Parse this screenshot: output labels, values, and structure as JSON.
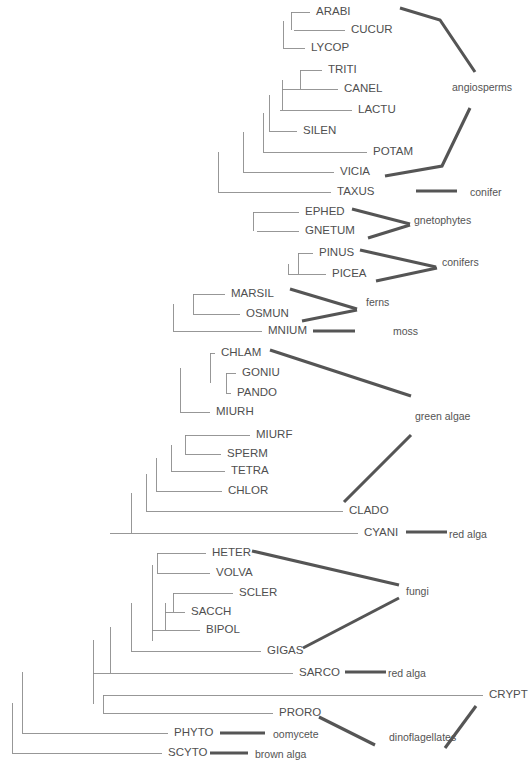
{
  "figure": {
    "type": "phylogenetic-tree",
    "orientation": "left-to-right-rectangular-cladogram",
    "line_color": "#8c8c8c",
    "bracket_color": "#555555",
    "text_color": "#4f4f4f",
    "background": "#ffffff",
    "width": 531,
    "height": 774
  },
  "taxa": [
    {
      "id": "ARABI",
      "label": "ARABI",
      "y": 12,
      "tip_x": 310,
      "label_x": 316
    },
    {
      "id": "CUCUR",
      "label": "CUCUR",
      "y": 30,
      "tip_x": 345,
      "label_x": 351
    },
    {
      "id": "LYCOP",
      "label": "LYCOP",
      "y": 48,
      "tip_x": 305,
      "label_x": 311
    },
    {
      "id": "TRITI",
      "label": "TRITI",
      "y": 70,
      "tip_x": 322,
      "label_x": 328
    },
    {
      "id": "CANEL",
      "label": "CANEL",
      "y": 89,
      "tip_x": 338,
      "label_x": 344
    },
    {
      "id": "LACTU",
      "label": "LACTU",
      "y": 110,
      "tip_x": 352,
      "label_x": 358
    },
    {
      "id": "SILEN",
      "label": "SILEN",
      "y": 131,
      "tip_x": 297,
      "label_x": 303
    },
    {
      "id": "POTAM",
      "label": "POTAM",
      "y": 152,
      "tip_x": 367,
      "label_x": 373
    },
    {
      "id": "VICIA",
      "label": "VICIA",
      "y": 172,
      "tip_x": 334,
      "label_x": 340
    },
    {
      "id": "TAXUS",
      "label": "TAXUS",
      "y": 192,
      "tip_x": 331,
      "label_x": 337
    },
    {
      "id": "EPHED",
      "label": "EPHED",
      "y": 212,
      "tip_x": 299,
      "label_x": 305
    },
    {
      "id": "GNETUM",
      "label": "GNETUM",
      "y": 231,
      "tip_x": 299,
      "label_x": 305
    },
    {
      "id": "PINUS",
      "label": "PINUS",
      "y": 253,
      "tip_x": 313,
      "label_x": 319
    },
    {
      "id": "PICEA",
      "label": "PICEA",
      "y": 274,
      "tip_x": 326,
      "label_x": 332
    },
    {
      "id": "MARSIL",
      "label": "MARSIL",
      "y": 294,
      "tip_x": 225,
      "label_x": 231
    },
    {
      "id": "OSMUN",
      "label": "OSMUN",
      "y": 314,
      "tip_x": 240,
      "label_x": 246
    },
    {
      "id": "MNIUM",
      "label": "MNIUM",
      "y": 331,
      "tip_x": 262,
      "label_x": 268
    },
    {
      "id": "CHLAM",
      "label": "CHLAM",
      "y": 353,
      "tip_x": 215,
      "label_x": 221
    },
    {
      "id": "GONIU",
      "label": "GONIU",
      "y": 373,
      "tip_x": 236,
      "label_x": 242
    },
    {
      "id": "PANDO",
      "label": "PANDO",
      "y": 393,
      "tip_x": 231,
      "label_x": 237
    },
    {
      "id": "MIURH",
      "label": "MIURH",
      "y": 412,
      "tip_x": 210,
      "label_x": 216
    },
    {
      "id": "MIURF",
      "label": "MIURF",
      "y": 435,
      "tip_x": 250,
      "label_x": 256
    },
    {
      "id": "SPERM",
      "label": "SPERM",
      "y": 454,
      "tip_x": 221,
      "label_x": 227
    },
    {
      "id": "TETRA",
      "label": "TETRA",
      "y": 471,
      "tip_x": 225,
      "label_x": 231
    },
    {
      "id": "CHLOR",
      "label": "CHLOR",
      "y": 491,
      "tip_x": 222,
      "label_x": 228
    },
    {
      "id": "CLADO",
      "label": "CLADO",
      "y": 511,
      "tip_x": 343,
      "label_x": 349
    },
    {
      "id": "CYANI",
      "label": "CYANI",
      "y": 533,
      "tip_x": 358,
      "label_x": 364
    },
    {
      "id": "HETER",
      "label": "HETER",
      "y": 553,
      "tip_x": 206,
      "label_x": 212
    },
    {
      "id": "VOLVA",
      "label": "VOLVA",
      "y": 573,
      "tip_x": 210,
      "label_x": 216
    },
    {
      "id": "SCLER",
      "label": "SCLER",
      "y": 593,
      "tip_x": 233,
      "label_x": 239
    },
    {
      "id": "SACCH",
      "label": "SACCH",
      "y": 612,
      "tip_x": 185,
      "label_x": 191
    },
    {
      "id": "BIPOL",
      "label": "BIPOL",
      "y": 630,
      "tip_x": 200,
      "label_x": 206
    },
    {
      "id": "GIGAS",
      "label": "GIGAS",
      "y": 651,
      "tip_x": 261,
      "label_x": 267
    },
    {
      "id": "SARCO",
      "label": "SARCO",
      "y": 673,
      "tip_x": 293,
      "label_x": 299
    },
    {
      "id": "CRYPT",
      "label": "CRYPT",
      "y": 695,
      "tip_x": 483,
      "label_x": 489
    },
    {
      "id": "PRORO",
      "label": "PRORO",
      "y": 713,
      "tip_x": 273,
      "label_x": 279
    },
    {
      "id": "PHYTO",
      "label": "PHYTO",
      "y": 733,
      "tip_x": 168,
      "label_x": 174
    },
    {
      "id": "SCYTO",
      "label": "SCYTO",
      "y": 753,
      "tip_x": 162,
      "label_x": 168
    }
  ],
  "clade_labels": [
    {
      "id": "angiosperms",
      "label": "angiosperms",
      "x": 452,
      "y": 88
    },
    {
      "id": "conifer",
      "label": "conifer",
      "x": 470,
      "y": 193
    },
    {
      "id": "gnetophytes",
      "label": "gnetophytes",
      "x": 414,
      "y": 221
    },
    {
      "id": "conifers",
      "label": "conifers",
      "x": 442,
      "y": 263
    },
    {
      "id": "ferns",
      "label": "ferns",
      "x": 366,
      "y": 303
    },
    {
      "id": "moss",
      "label": "moss",
      "x": 393,
      "y": 332
    },
    {
      "id": "green-algae",
      "label": "green algae",
      "x": 415,
      "y": 417
    },
    {
      "id": "red-alga-cyani",
      "label": "red alga",
      "x": 449,
      "y": 535
    },
    {
      "id": "fungi",
      "label": "fungi",
      "x": 406,
      "y": 592
    },
    {
      "id": "red-alga-sarco",
      "label": "red alga",
      "x": 388,
      "y": 674
    },
    {
      "id": "dinoflagellates",
      "label": "dinoflagellates",
      "x": 389,
      "y": 738
    },
    {
      "id": "oomycete",
      "label": "oomycete",
      "x": 273,
      "y": 735
    },
    {
      "id": "brown-alga",
      "label": "brown alga",
      "x": 255,
      "y": 755
    }
  ],
  "brackets": [
    {
      "id": "angiosperms-upper",
      "points": "400,8 440,20 475,72"
    },
    {
      "id": "angiosperms-lower",
      "points": "385,176 442,166 470,108"
    },
    {
      "id": "conifer-bar",
      "points": "416,191 457,191"
    },
    {
      "id": "gnetophytes-upper",
      "points": "352,209 410,224"
    },
    {
      "id": "gnetophytes-lower",
      "points": "368,238 410,225"
    },
    {
      "id": "conifers-upper",
      "points": "360,250 436,267"
    },
    {
      "id": "conifers-lower",
      "points": "376,281 437,268"
    },
    {
      "id": "ferns-upper",
      "points": "290,289 357,309"
    },
    {
      "id": "ferns-lower",
      "points": "302,321 357,310"
    },
    {
      "id": "green-algae-upper",
      "points": "270,350 411,396"
    },
    {
      "id": "green-algae-lower",
      "points": "344,502 411,435"
    },
    {
      "id": "moss-bar",
      "points": "313,331 355,331"
    },
    {
      "id": "red-alga-cyani-bar",
      "points": "406,532 447,532"
    },
    {
      "id": "fungi-upper",
      "points": "252,551 399,585"
    },
    {
      "id": "fungi-lower",
      "points": "303,648 399,598"
    },
    {
      "id": "red-alga-sarco-bar",
      "points": "345,672 386,672"
    },
    {
      "id": "dinoflagellates-up",
      "points": "319,717 375,745"
    },
    {
      "id": "crypt-down",
      "points": "476,706 445,748"
    },
    {
      "id": "oomycete-bar",
      "points": "220,733 265,733"
    },
    {
      "id": "brown-alga-bar",
      "points": "210,753 248,753"
    }
  ],
  "tree_edges": {
    "description": "rectangular cladogram horizontal and vertical segments",
    "horizontal": [
      [
        291,
        12,
        310
      ],
      [
        294,
        30,
        345
      ],
      [
        283,
        48,
        305
      ],
      [
        300,
        70,
        322
      ],
      [
        282,
        89,
        338
      ],
      [
        280,
        110,
        352
      ],
      [
        269,
        131,
        297
      ],
      [
        263,
        152,
        367
      ],
      [
        243,
        172,
        334
      ],
      [
        218,
        192,
        331
      ],
      [
        253,
        212,
        299
      ],
      [
        257,
        231,
        299
      ],
      [
        298,
        253,
        313
      ],
      [
        288,
        274,
        326
      ],
      [
        193,
        294,
        225
      ],
      [
        193,
        314,
        240
      ],
      [
        173,
        331,
        262
      ],
      [
        210,
        353,
        215
      ],
      [
        226,
        373,
        236
      ],
      [
        226,
        393,
        231
      ],
      [
        180,
        412,
        210
      ],
      [
        185,
        435,
        250
      ],
      [
        185,
        454,
        221
      ],
      [
        171,
        471,
        225
      ],
      [
        156,
        491,
        222
      ],
      [
        146,
        511,
        343
      ],
      [
        110,
        533,
        358
      ],
      [
        157,
        553,
        206
      ],
      [
        157,
        573,
        210
      ],
      [
        173,
        593,
        233
      ],
      [
        165,
        612,
        185
      ],
      [
        152,
        630,
        200
      ],
      [
        131,
        651,
        261
      ],
      [
        93,
        673,
        293
      ],
      [
        103,
        695,
        483
      ],
      [
        103,
        713,
        273
      ],
      [
        22,
        733,
        168
      ],
      [
        12,
        753,
        162
      ]
    ],
    "vertical": [
      [
        291,
        12,
        30
      ],
      [
        283,
        21,
        48
      ],
      [
        300,
        70,
        89
      ],
      [
        282,
        79.5,
        110
      ],
      [
        269,
        94.75,
        131
      ],
      [
        263,
        112.9,
        152
      ],
      [
        243,
        132.4,
        172
      ],
      [
        218,
        152.2,
        192
      ],
      [
        253,
        212,
        231
      ],
      [
        298,
        253,
        274
      ],
      [
        288,
        263.5,
        274
      ],
      [
        193,
        294,
        314
      ],
      [
        173,
        304,
        331
      ],
      [
        210,
        353,
        383
      ],
      [
        226,
        373,
        393
      ],
      [
        180,
        368,
        412
      ],
      [
        185,
        435,
        454
      ],
      [
        171,
        444.5,
        471
      ],
      [
        156,
        457.8,
        491
      ],
      [
        146,
        474.4,
        511
      ],
      [
        131,
        492.7,
        533
      ],
      [
        157,
        553,
        573
      ],
      [
        173,
        593,
        612
      ],
      [
        165,
        602.5,
        630
      ],
      [
        152,
        565,
        640.5
      ],
      [
        131,
        602.75,
        651
      ],
      [
        110,
        626.9,
        673
      ],
      [
        103,
        695,
        713
      ],
      [
        93,
        639.9,
        704
      ],
      [
        22,
        671.9,
        733
      ],
      [
        12,
        702.5,
        753
      ]
    ]
  }
}
